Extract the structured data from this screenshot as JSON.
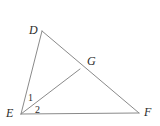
{
  "figure": {
    "type": "geometry-diagram",
    "width": 160,
    "height": 126,
    "background_color": "#ffffff",
    "stroke_color": "#8a8a8a",
    "stroke_width": 1,
    "label_color": "#2b2b2b"
  },
  "points": {
    "D": {
      "label": "D",
      "x": 42,
      "y": 31,
      "label_x": 29,
      "label_y": 24
    },
    "E": {
      "label": "E",
      "x": 21,
      "y": 114,
      "label_x": 6,
      "label_y": 107
    },
    "F": {
      "label": "F",
      "x": 139,
      "y": 113,
      "label_x": 144,
      "label_y": 106
    },
    "G": {
      "label": "G",
      "x": 80,
      "y": 69,
      "label_x": 87,
      "label_y": 55
    }
  },
  "segments": [
    {
      "name": "DE",
      "from": "D",
      "to": "E"
    },
    {
      "name": "DF",
      "from": "D",
      "to": "F"
    },
    {
      "name": "EF",
      "from": "E",
      "to": "F"
    },
    {
      "name": "EG",
      "from": "E",
      "to": "G"
    }
  ],
  "angle_labels": [
    {
      "name": "angle-1",
      "label": "1",
      "at_vertex": "E",
      "between": [
        "ED",
        "EG"
      ],
      "x": 28,
      "y": 93
    },
    {
      "name": "angle-2",
      "label": "2",
      "at_vertex": "E",
      "between": [
        "EG",
        "EF"
      ],
      "x": 35,
      "y": 105
    }
  ]
}
